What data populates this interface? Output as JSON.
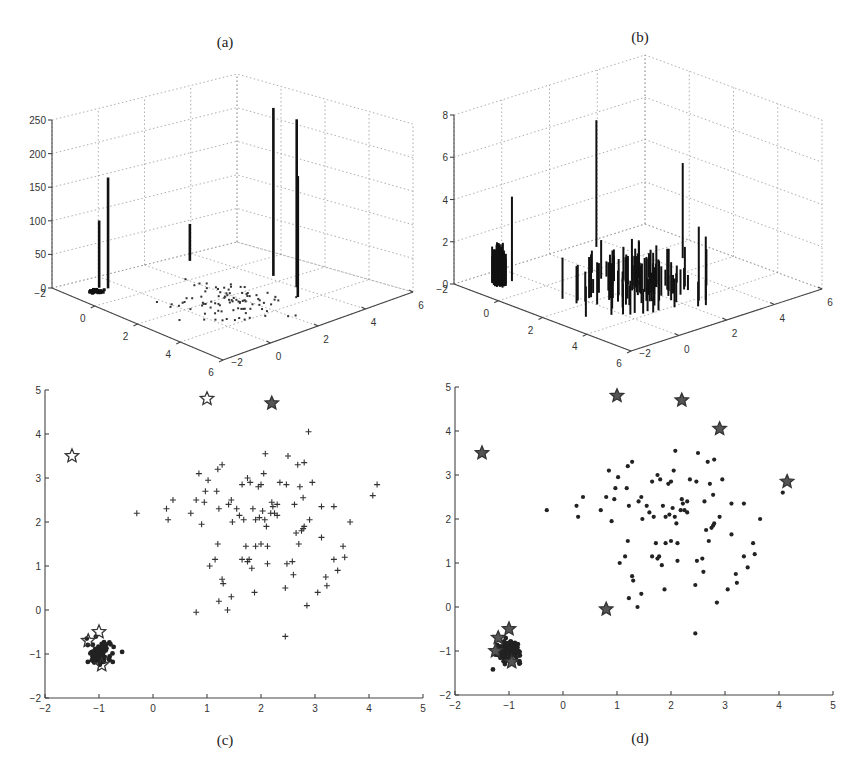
{
  "figure": {
    "panels": [
      {
        "id": "a",
        "label": "(a)"
      },
      {
        "id": "b",
        "label": "(b)"
      },
      {
        "id": "c",
        "label": "(c)"
      },
      {
        "id": "d",
        "label": "(d)"
      }
    ]
  },
  "chart_data": [
    {
      "panel": "(a)",
      "type": "bar3d-stem",
      "title": "(a)",
      "zlim": [
        0,
        250
      ],
      "zticks": [
        "0",
        "50",
        "100",
        "150",
        "200",
        "250"
      ],
      "xticks": [
        "-2",
        "0",
        "2",
        "4",
        "6"
      ],
      "yticks": [
        "-2",
        "0",
        "2",
        "4",
        "6"
      ],
      "xlim": [
        -2,
        6
      ],
      "ylim": [
        -2,
        6
      ],
      "grid": true,
      "description": "Stem heights at sample locations; most points near 0, a few outliers with large weights",
      "stems": [
        {
          "x": -1.5,
          "y": 3.5,
          "z": 55
        },
        {
          "x": -1.2,
          "y": -0.7,
          "z": 100
        },
        {
          "x": -1.0,
          "y": -0.5,
          "z": 165
        },
        {
          "x": 1.0,
          "y": 4.8,
          "z": 250
        },
        {
          "x": 2.2,
          "y": 4.7,
          "z": 250
        },
        {
          "x": 2.9,
          "y": 4.1,
          "z": 180
        }
      ]
    },
    {
      "panel": "(b)",
      "type": "bar3d-stem",
      "title": "(b)",
      "zlim": [
        0,
        8
      ],
      "zticks": [
        "0",
        "2",
        "4",
        "6",
        "8"
      ],
      "xticks": [
        "-2",
        "0",
        "2",
        "4",
        "6"
      ],
      "yticks": [
        "-2",
        "0",
        "2",
        "4",
        "6"
      ],
      "xlim": [
        -2,
        6
      ],
      "ylim": [
        -2,
        6
      ],
      "grid": true,
      "description": "Stem heights after reweighting; dense cluster near (-1,-1) with heights ~1-2, spread cluster near (2,2) with heights ~0.5-2, a few taller stems up to ~6",
      "stems": [
        {
          "x": -1.5,
          "y": 3.5,
          "z": 6
        },
        {
          "x": -1.0,
          "y": -0.5,
          "z": 4
        },
        {
          "x": 1.0,
          "y": 4.8,
          "z": 4.5
        },
        {
          "x": 4.1,
          "y": 2.6,
          "z": 3.5
        },
        {
          "x": 4.2,
          "y": 2.8,
          "z": 3
        }
      ]
    },
    {
      "panel": "(c)",
      "type": "scatter",
      "title": "(c)",
      "xlim": [
        -2,
        5
      ],
      "ylim": [
        -2,
        5
      ],
      "xticks": [
        "-2",
        "-1",
        "0",
        "1",
        "2",
        "3",
        "4",
        "5"
      ],
      "yticks": [
        "-2",
        "-1",
        "0",
        "1",
        "2",
        "3",
        "4",
        "5"
      ],
      "series": [
        {
          "name": "cluster points",
          "marker": "+",
          "points": [
            [
              -0.3,
              2.2
            ],
            [
              0.25,
              2.3
            ],
            [
              0.28,
              2.05
            ],
            [
              0.37,
              2.5
            ],
            [
              0.7,
              2.2
            ],
            [
              0.8,
              -0.05
            ],
            [
              0.8,
              2.5
            ],
            [
              0.85,
              3.1
            ],
            [
              0.9,
              1.95
            ],
            [
              0.95,
              2.45
            ],
            [
              0.97,
              2.7
            ],
            [
              1.02,
              2.95
            ],
            [
              1.05,
              1.0
            ],
            [
              1.15,
              1.15
            ],
            [
              1.18,
              2.7
            ],
            [
              1.2,
              1.5
            ],
            [
              1.2,
              3.2
            ],
            [
              1.22,
              0.2
            ],
            [
              1.22,
              2.3
            ],
            [
              1.28,
              3.3
            ],
            [
              1.28,
              0.7
            ],
            [
              1.3,
              0.6
            ],
            [
              1.38,
              0.0
            ],
            [
              1.4,
              2.4
            ],
            [
              1.45,
              2.5
            ],
            [
              1.45,
              0.3
            ],
            [
              1.47,
              2.0
            ],
            [
              1.55,
              2.3
            ],
            [
              1.6,
              2.15
            ],
            [
              1.65,
              2.85
            ],
            [
              1.65,
              1.15
            ],
            [
              1.68,
              2.05
            ],
            [
              1.72,
              1.45
            ],
            [
              1.75,
              3.0
            ],
            [
              1.75,
              1.1
            ],
            [
              1.78,
              1.15
            ],
            [
              1.8,
              2.9
            ],
            [
              1.83,
              0.95
            ],
            [
              1.85,
              2.3
            ],
            [
              1.88,
              0.4
            ],
            [
              1.9,
              1.45
            ],
            [
              1.9,
              2.05
            ],
            [
              1.95,
              2.8
            ],
            [
              1.97,
              2.1
            ],
            [
              2.0,
              2.85
            ],
            [
              2.0,
              1.5
            ],
            [
              2.03,
              2.25
            ],
            [
              2.05,
              3.1
            ],
            [
              2.07,
              2.05
            ],
            [
              2.08,
              3.55
            ],
            [
              2.1,
              1.9
            ],
            [
              2.12,
              1.45
            ],
            [
              2.12,
              1.05
            ],
            [
              2.18,
              2.2
            ],
            [
              2.2,
              2.45
            ],
            [
              2.22,
              2.35
            ],
            [
              2.25,
              2.2
            ],
            [
              2.3,
              2.4
            ],
            [
              2.3,
              2.15
            ],
            [
              2.35,
              2.9
            ],
            [
              2.45,
              0.5
            ],
            [
              2.45,
              -0.6
            ],
            [
              2.47,
              2.85
            ],
            [
              2.48,
              1.05
            ],
            [
              2.5,
              3.5
            ],
            [
              2.58,
              1.1
            ],
            [
              2.6,
              0.8
            ],
            [
              2.62,
              2.4
            ],
            [
              2.65,
              1.75
            ],
            [
              2.68,
              3.3
            ],
            [
              2.7,
              1.5
            ],
            [
              2.72,
              2.8
            ],
            [
              2.75,
              1.8
            ],
            [
              2.78,
              1.85
            ],
            [
              2.8,
              1.9
            ],
            [
              2.8,
              3.35
            ],
            [
              2.78,
              2.55
            ],
            [
              2.85,
              0.1
            ],
            [
              2.88,
              4.05
            ],
            [
              2.9,
              2.05
            ],
            [
              2.95,
              2.9
            ],
            [
              3.05,
              0.4
            ],
            [
              3.12,
              2.35
            ],
            [
              3.12,
              1.65
            ],
            [
              3.2,
              0.75
            ],
            [
              3.22,
              0.55
            ],
            [
              3.35,
              1.15
            ],
            [
              3.35,
              2.35
            ],
            [
              3.42,
              0.9
            ],
            [
              3.52,
              1.45
            ],
            [
              3.55,
              1.2
            ],
            [
              3.65,
              2.0
            ],
            [
              4.07,
              2.6
            ],
            [
              4.15,
              2.85
            ]
          ]
        },
        {
          "name": "outlier cluster",
          "marker": "filled dots",
          "center": [
            -1.0,
            -1.0
          ],
          "spread": 0.2
        },
        {
          "name": "outliers",
          "marker": "star (hollow)",
          "points": [
            [
              -1.5,
              3.5
            ],
            [
              1.0,
              4.8
            ],
            [
              -1.0,
              -0.5
            ],
            [
              -1.2,
              -0.7
            ],
            [
              -0.95,
              -1.25
            ]
          ]
        },
        {
          "name": "outliers (filled)",
          "marker": "star (filled)",
          "points": [
            [
              2.2,
              4.7
            ]
          ]
        }
      ]
    },
    {
      "panel": "(d)",
      "type": "scatter",
      "title": "(d)",
      "xlim": [
        -2,
        5
      ],
      "ylim": [
        -2,
        5
      ],
      "xticks": [
        "-2",
        "-1",
        "0",
        "1",
        "2",
        "3",
        "4",
        "5"
      ],
      "yticks": [
        "-2",
        "-1",
        "0",
        "1",
        "2",
        "3",
        "4",
        "5"
      ],
      "series": [
        {
          "name": "cluster points",
          "marker": "dot",
          "points": [
            [
              -0.3,
              2.2
            ],
            [
              0.25,
              2.3
            ],
            [
              0.28,
              2.05
            ],
            [
              0.37,
              2.5
            ],
            [
              0.7,
              2.2
            ],
            [
              0.8,
              2.5
            ],
            [
              0.85,
              3.1
            ],
            [
              0.9,
              1.95
            ],
            [
              0.95,
              2.45
            ],
            [
              0.97,
              2.7
            ],
            [
              1.02,
              2.95
            ],
            [
              1.05,
              1.0
            ],
            [
              1.15,
              1.15
            ],
            [
              1.18,
              2.7
            ],
            [
              1.2,
              1.5
            ],
            [
              1.2,
              3.2
            ],
            [
              1.22,
              0.2
            ],
            [
              1.22,
              2.3
            ],
            [
              1.28,
              3.3
            ],
            [
              1.28,
              0.7
            ],
            [
              1.3,
              0.6
            ],
            [
              1.38,
              0.0
            ],
            [
              1.4,
              2.4
            ],
            [
              1.45,
              2.5
            ],
            [
              1.45,
              0.3
            ],
            [
              1.47,
              2.0
            ],
            [
              1.55,
              2.3
            ],
            [
              1.6,
              2.15
            ],
            [
              1.65,
              2.85
            ],
            [
              1.65,
              1.15
            ],
            [
              1.68,
              2.05
            ],
            [
              1.72,
              1.45
            ],
            [
              1.75,
              3.0
            ],
            [
              1.75,
              1.1
            ],
            [
              1.78,
              1.15
            ],
            [
              1.8,
              2.9
            ],
            [
              1.83,
              0.95
            ],
            [
              1.85,
              2.3
            ],
            [
              1.88,
              0.4
            ],
            [
              1.9,
              1.45
            ],
            [
              1.9,
              2.05
            ],
            [
              1.95,
              2.8
            ],
            [
              1.97,
              2.1
            ],
            [
              2.0,
              2.85
            ],
            [
              2.0,
              1.5
            ],
            [
              2.03,
              2.25
            ],
            [
              2.05,
              3.1
            ],
            [
              2.07,
              2.05
            ],
            [
              2.08,
              3.55
            ],
            [
              2.1,
              1.9
            ],
            [
              2.12,
              1.45
            ],
            [
              2.12,
              1.05
            ],
            [
              2.18,
              2.2
            ],
            [
              2.2,
              2.45
            ],
            [
              2.22,
              2.35
            ],
            [
              2.25,
              2.2
            ],
            [
              2.3,
              2.4
            ],
            [
              2.3,
              2.15
            ],
            [
              2.35,
              2.9
            ],
            [
              2.45,
              0.5
            ],
            [
              2.45,
              -0.6
            ],
            [
              2.47,
              2.85
            ],
            [
              2.48,
              1.05
            ],
            [
              2.5,
              3.5
            ],
            [
              2.58,
              1.1
            ],
            [
              2.6,
              0.8
            ],
            [
              2.62,
              2.4
            ],
            [
              2.65,
              1.75
            ],
            [
              2.68,
              3.3
            ],
            [
              2.7,
              1.5
            ],
            [
              2.72,
              2.8
            ],
            [
              2.75,
              1.8
            ],
            [
              2.78,
              1.85
            ],
            [
              2.8,
              1.9
            ],
            [
              2.8,
              3.35
            ],
            [
              2.78,
              2.55
            ],
            [
              2.85,
              0.1
            ],
            [
              2.9,
              2.05
            ],
            [
              2.95,
              2.9
            ],
            [
              3.05,
              0.4
            ],
            [
              3.12,
              2.35
            ],
            [
              3.12,
              1.65
            ],
            [
              3.2,
              0.75
            ],
            [
              3.22,
              0.55
            ],
            [
              3.35,
              1.15
            ],
            [
              3.35,
              2.35
            ],
            [
              3.42,
              0.9
            ],
            [
              3.52,
              1.45
            ],
            [
              3.55,
              1.2
            ],
            [
              3.65,
              2.0
            ],
            [
              4.07,
              2.6
            ]
          ]
        },
        {
          "name": "outlier cluster",
          "marker": "filled dots + stars",
          "center": [
            -1.0,
            -1.0
          ],
          "spread": 0.2
        },
        {
          "name": "outliers",
          "marker": "star (filled)",
          "points": [
            [
              -1.5,
              3.5
            ],
            [
              1.0,
              4.8
            ],
            [
              2.2,
              4.7
            ],
            [
              2.9,
              4.05
            ],
            [
              4.15,
              2.85
            ],
            [
              0.8,
              -0.05
            ],
            [
              -1.0,
              -0.5
            ],
            [
              -1.2,
              -0.7
            ],
            [
              -1.25,
              -1.0
            ],
            [
              -0.95,
              -1.25
            ]
          ]
        }
      ]
    }
  ]
}
